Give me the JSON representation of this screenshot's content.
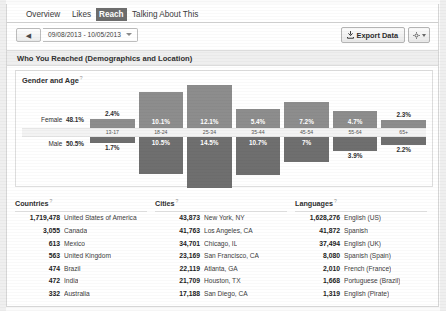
{
  "tabs": [
    {
      "id": "overview",
      "label": "Overview",
      "active": false
    },
    {
      "id": "likes",
      "label": "Likes",
      "active": false
    },
    {
      "id": "reach",
      "label": "Reach",
      "active": true
    },
    {
      "id": "talking",
      "label": "Talking About This",
      "active": false
    }
  ],
  "toolbar": {
    "back_glyph": "◀",
    "date_range": "09/08/2013 - 10/05/2013",
    "export_label": "Export Data",
    "gear_glyph": "⚙"
  },
  "section": {
    "title": "Who You Reached (Demographics and Location)"
  },
  "gender_age": {
    "title": "Gender and Age",
    "help": "?",
    "female_label": "Female",
    "female_total": "48.1%",
    "male_label": "Male",
    "male_total": "50.5%"
  },
  "chart_data": {
    "type": "bar",
    "title": "Gender and Age",
    "xlabel": "",
    "ylabel": "Percent of people reached",
    "categories": [
      "13-17",
      "18-24",
      "25-34",
      "35-44",
      "45-54",
      "55-64",
      "65+"
    ],
    "series": [
      {
        "name": "Female",
        "total": "48.1%",
        "values": [
          2.4,
          10.1,
          12.1,
          5.4,
          7.2,
          4.7,
          2.3
        ],
        "labels": [
          "2.4%",
          "10.1%",
          "12.1%",
          "5.4%",
          "7.2%",
          "4.7%",
          "2.3%"
        ],
        "color": "#8d8d8d"
      },
      {
        "name": "Male",
        "total": "50.5%",
        "values": [
          1.7,
          10.5,
          14.5,
          10.7,
          7.0,
          3.9,
          2.2
        ],
        "labels": [
          "1.7%",
          "10.5%",
          "14.5%",
          "10.7%",
          "7%",
          "3.9%",
          "2.2%"
        ],
        "color": "#6f6f6f"
      }
    ],
    "ylim": [
      0,
      15
    ],
    "grid": false,
    "legend": "row-labels-left"
  },
  "countries": {
    "header": "Countries",
    "help": "?",
    "rows": [
      {
        "value": "1,719,478",
        "name": "United States of America"
      },
      {
        "value": "3,055",
        "name": "Canada"
      },
      {
        "value": "613",
        "name": "Mexico"
      },
      {
        "value": "563",
        "name": "United Kingdom"
      },
      {
        "value": "474",
        "name": "Brazil"
      },
      {
        "value": "472",
        "name": "India"
      },
      {
        "value": "332",
        "name": "Australia"
      }
    ]
  },
  "cities": {
    "header": "Cities",
    "help": "?",
    "rows": [
      {
        "value": "43,873",
        "name": "New York, NY"
      },
      {
        "value": "41,763",
        "name": "Los Angeles, CA"
      },
      {
        "value": "34,701",
        "name": "Chicago, IL"
      },
      {
        "value": "23,169",
        "name": "San Francisco, CA"
      },
      {
        "value": "22,119",
        "name": "Atlanta, GA"
      },
      {
        "value": "21,709",
        "name": "Houston, TX"
      },
      {
        "value": "17,188",
        "name": "San Diego, CA"
      }
    ]
  },
  "languages": {
    "header": "Languages",
    "help": "?",
    "rows": [
      {
        "value": "1,628,276",
        "name": "English (US)"
      },
      {
        "value": "41,872",
        "name": "Spanish"
      },
      {
        "value": "37,494",
        "name": "English (UK)"
      },
      {
        "value": "8,080",
        "name": "Spanish (Spain)"
      },
      {
        "value": "2,010",
        "name": "French (France)"
      },
      {
        "value": "1,668",
        "name": "Portuguese (Brazil)"
      },
      {
        "value": "1,319",
        "name": "English (Pirate)"
      }
    ]
  },
  "colors": {
    "female_bar": "#8d8d8d",
    "male_bar": "#6f6f6f",
    "active_tab": "#6d6d6d"
  }
}
